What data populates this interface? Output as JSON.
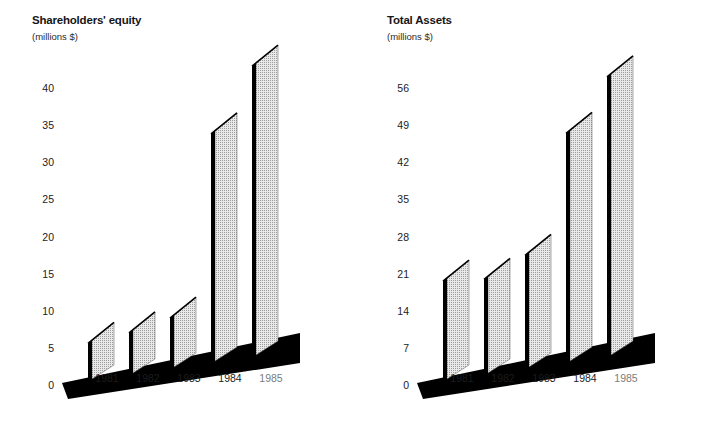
{
  "charts": [
    {
      "id": "shareholders-equity",
      "title": "Shareholders' equity",
      "subtitle": "(millions $)",
      "yticks": [
        "0",
        "5",
        "10",
        "15",
        "20",
        "25",
        "30",
        "35",
        "40"
      ],
      "xlabels": [
        "1981",
        "1982",
        "1983",
        "1984",
        "1985"
      ],
      "highlight_label": "1985"
    },
    {
      "id": "total-assets",
      "title": "Total Assets",
      "subtitle": "(millions $)",
      "yticks": [
        "0",
        "7",
        "14",
        "21",
        "28",
        "35",
        "42",
        "49",
        "56"
      ],
      "xlabels": [
        "1981",
        "1982",
        "1983",
        "1984",
        "1985"
      ],
      "highlight_label": "1985"
    }
  ],
  "colors": {
    "bar_face": "#d6d6d6",
    "bar_edge": "#000000",
    "ground": "#000000",
    "text": "#1c1c1c",
    "text_dim": "#7c7c7c",
    "background": "#ffffff"
  },
  "chart_data": [
    {
      "type": "bar",
      "title": "Shareholders' equity",
      "subtitle": "(millions $)",
      "xlabel": "",
      "ylabel": "millions $",
      "categories": [
        "1981",
        "1982",
        "1983",
        "1984",
        "1985"
      ],
      "values": [
        5.2,
        5.8,
        7.0,
        31.0,
        39.3
      ],
      "ylim": [
        0,
        40
      ],
      "yticks": [
        0,
        5,
        10,
        15,
        20,
        25,
        30,
        35,
        40
      ],
      "grid": false,
      "legend": false,
      "style": "3d-perspective-bars"
    },
    {
      "type": "bar",
      "title": "Total Assets",
      "subtitle": "(millions $)",
      "xlabel": "",
      "ylabel": "millions $",
      "categories": [
        "1981",
        "1982",
        "1983",
        "1984",
        "1985"
      ],
      "values": [
        19.0,
        18.2,
        21.6,
        43.5,
        53.0
      ],
      "ylim": [
        0,
        56
      ],
      "yticks": [
        0,
        7,
        14,
        21,
        28,
        35,
        42,
        49,
        56
      ],
      "grid": false,
      "legend": false,
      "style": "3d-perspective-bars"
    }
  ]
}
